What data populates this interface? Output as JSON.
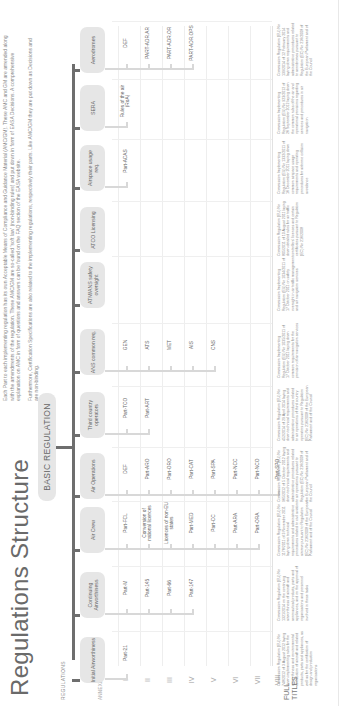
{
  "title": "Regulations Structure",
  "intro": {
    "p1": "Each Part to each implementing regulation has its own Acceptable Means of Compliance and Guidance Material (AMC/GM). These AMC and GM are amended along with the amendments of the regulation. These AMC/GM are so-called 'soft law' (non-binding rules) and put down in form of EASA Decisions. A comprehensive explanation on AMC in form of questions and answers can be found on the FAQ section of the EASA website.",
    "p2": "Furthermore, Certification Specifications are also related to the implementing regulations, respectively their parts. Like AMC/GM they are put down as Decisions and are non-binding."
  },
  "basic_regulation": "BASIC REGULATION",
  "labels": {
    "regulations": "REGULATIONS",
    "annexes": "ANNEXES",
    "full_titles": "FULL TITLES"
  },
  "annex_numerals": [
    "I",
    "II",
    "III",
    "IV",
    "V",
    "VI",
    "VII",
    "VIII"
  ],
  "colors": {
    "spine": "#6e6e6e",
    "box": "#e6e6e6",
    "bracket": "#d8d8d8",
    "text": "#666666"
  },
  "categories": [
    {
      "name": "Initial Airworthiness",
      "parts": [
        "Part-21"
      ],
      "full_title": "Commission Regulation (EU) No 748/2012 of 3 August 2012 laying down implementing rules for the airworthiness and environmental certification of aircraft and related products, parts and appliances, as well as for the certification of design and production organisations"
    },
    {
      "name": "Continuing Airworthiness",
      "parts": [
        "Part-M",
        "Part-145",
        "Part-66",
        "Part-147"
      ],
      "full_title": "Commission Regulation (EU) No 1321/2014 on the continuing airworthiness of aircraft and aeronautical products, parts and appliances, and on the approval of organisations and personnel involved in these tasks"
    },
    {
      "name": "Air Crew",
      "parts": [
        "Part-FCL",
        "Conversion of national licences",
        "Licences of non-EU states",
        "Part-MED",
        "Part-CC",
        "Part-ARA",
        "Part-ORA"
      ],
      "full_title": "Commission Regulation (EU) No 1178/2011 of 3 November 2011 laying down technical requirements and administrative procedures related to civil aviation aircrew pursuant to Regulation (EC) No 216/2008 of the European Parliament and of the Council"
    },
    {
      "name": "Air Operations",
      "parts": [
        "DEF",
        "Part-ARO",
        "Part-ORO",
        "Part-CAT",
        "Part-SPA",
        "Part-NCC",
        "Part-NCO",
        "Part-SPO"
      ],
      "full_title": "Commission Regulation (EU) No 965/2012 of 5 October 2012 laying down technical requirements and administrative procedures related to air operations pursuant to Regulation (EC) No 216/2008 of the European Parliament and of the Council"
    },
    {
      "name": "Third country operators",
      "parts": [
        "Part-TCO",
        "Part-ART"
      ],
      "full_title": "Commission Regulation (EU) No 452/2014 of 29 April 2014 laying down technical requirements and administrative procedures related to air operations of third country operators pursuant to Regulation (EC) No 216/2008 of the European Parliament and of the Council"
    },
    {
      "name": "ANS common req.",
      "parts": [
        "GEN",
        "ATS",
        "MET",
        "AIS",
        "CNS"
      ],
      "full_title": "Commission Implementing Regulation (EU) No 1035/2011 of 17 October 2011 laying down common requirements for the provision of air navigation services"
    },
    {
      "name": "ATM/ANS safety oversight",
      "parts": [],
      "full_title": "Commission Implementing Regulation (EU) No 1034/2011 of 17 October 2011 on safety oversight in air traffic management and air navigation services"
    },
    {
      "name": "ATCO Licensing",
      "parts": [],
      "full_title": "Commission Regulation (EU) No 805/2011 of 10 August 2011 laying down detailed rules for air traffic controllers' licences and certain certificates pursuant to Regulation (EC) No 216/2008"
    },
    {
      "name": "Airspace usage req.",
      "parts": [
        "Part-ACAS"
      ],
      "full_title": "Commission Implementing Regulation (EU) No 1332/2011 of 16 December 2011 laying down common airspace usage requirements and operating procedures for airborne collision avoidance"
    },
    {
      "name": "SERA",
      "parts": [
        "Rules of the air (RoA)"
      ],
      "full_title": "Commission Implementing Regulation (EU) No 923/2012 of 26 September 2012 laying down the common rules of the air and operational provisions regarding services and procedures in air navigation"
    },
    {
      "name": "Aerodromes",
      "parts": [
        "DEF",
        "PART-ADR.AR",
        "PART-ADR.OR",
        "PART-ADR.OPS"
      ],
      "full_title": "Commission Regulation (EU) No 139/2014 of 12 February 2014 laying down requirements and administrative procedures related to aerodromes pursuant to Regulation (EC) No 216/2008 of the European Parliament and of the Council"
    }
  ]
}
